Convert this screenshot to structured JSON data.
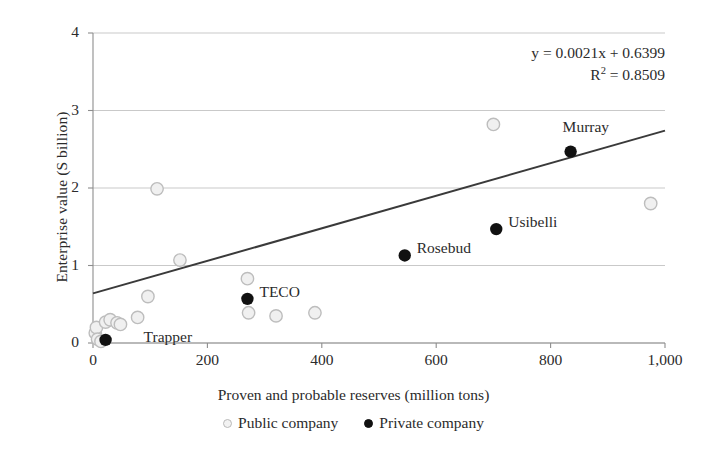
{
  "chart_data": {
    "type": "scatter",
    "title": "",
    "xlabel": "Proven and probable reserves (million tons)",
    "ylabel": "Enterprise value (S billion)",
    "xlim": [
      0,
      1000
    ],
    "ylim": [
      0,
      4
    ],
    "xticks": [
      0,
      200,
      400,
      600,
      800,
      1000
    ],
    "xtick_labels": [
      "0",
      "200",
      "400",
      "600",
      "800",
      "1,000"
    ],
    "yticks": [
      0,
      1,
      2,
      3,
      4
    ],
    "ytick_labels": [
      "0",
      "1",
      "2",
      "3",
      "4"
    ],
    "grid": "horizontal",
    "legend_position": "bottom-center",
    "annotations": {
      "equation": "y = 0.0021x + 0.6399",
      "r_squared_prefix": "R",
      "r_squared_exp": "2",
      "r_squared_value": " = 0.8509"
    },
    "trendline": {
      "slope": 0.0021,
      "intercept": 0.6399,
      "r2": 0.8509,
      "color": "#3a3a3a",
      "x_start": 0,
      "x_end": 1000
    },
    "series": [
      {
        "name": "Public company",
        "marker": "open-circle",
        "color": "#f0f0f0",
        "edge_color": "#bdbdbd",
        "points": [
          {
            "x": 4,
            "y": 0.13
          },
          {
            "x": 6,
            "y": 0.2
          },
          {
            "x": 8,
            "y": 0.05
          },
          {
            "x": 14,
            "y": 0.02
          },
          {
            "x": 22,
            "y": 0.27
          },
          {
            "x": 30,
            "y": 0.3
          },
          {
            "x": 42,
            "y": 0.26
          },
          {
            "x": 48,
            "y": 0.24
          },
          {
            "x": 78,
            "y": 0.33
          },
          {
            "x": 96,
            "y": 0.6
          },
          {
            "x": 112,
            "y": 1.99
          },
          {
            "x": 152,
            "y": 1.07
          },
          {
            "x": 270,
            "y": 0.83
          },
          {
            "x": 272,
            "y": 0.39
          },
          {
            "x": 320,
            "y": 0.35
          },
          {
            "x": 388,
            "y": 0.39
          },
          {
            "x": 700,
            "y": 2.82
          },
          {
            "x": 975,
            "y": 1.8
          }
        ]
      },
      {
        "name": "Private company",
        "marker": "filled-circle",
        "color": "#111111",
        "points": [
          {
            "x": 22,
            "y": 0.04,
            "label": "Trapper",
            "label_dx": 38,
            "label_dy": -4
          },
          {
            "x": 270,
            "y": 0.57,
            "label": "TECO",
            "label_dx": 12,
            "label_dy": -8
          },
          {
            "x": 545,
            "y": 1.13,
            "label": "Rosebud",
            "label_dx": 12,
            "label_dy": -8
          },
          {
            "x": 705,
            "y": 1.47,
            "label": "Usibelli",
            "label_dx": 12,
            "label_dy": -8
          },
          {
            "x": 835,
            "y": 2.47,
            "label": "Murray",
            "label_dx": -8,
            "label_dy": -26
          }
        ]
      }
    ]
  },
  "legend": {
    "items": [
      {
        "label": "Public company",
        "marker": "public"
      },
      {
        "label": "Private company",
        "marker": "private"
      }
    ]
  },
  "colors": {
    "axis": "#8d8d8d",
    "grid": "#c9c9c9",
    "text": "#2b2b2b",
    "trend": "#3a3a3a",
    "private_marker": "#111111",
    "public_marker_fill": "#f0f0f0",
    "public_marker_edge": "#bdbdbd"
  }
}
